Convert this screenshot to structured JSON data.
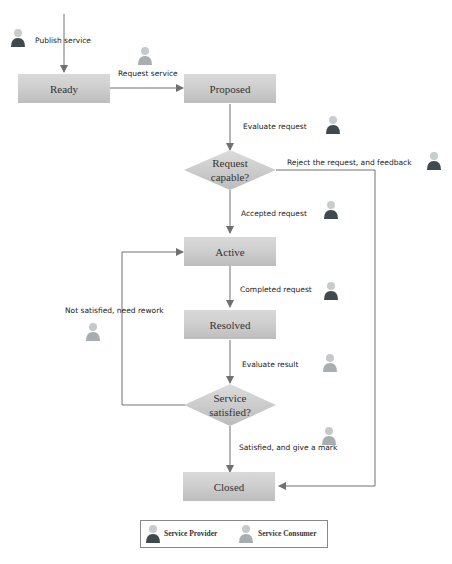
{
  "diagram": {
    "states": {
      "ready": "Ready",
      "proposed": "Proposed",
      "active": "Active",
      "resolved": "Resolved",
      "closed": "Closed"
    },
    "decisions": {
      "request_capable": [
        "Request",
        "capable?"
      ],
      "service_satisfied": [
        "Service",
        "satisfied?"
      ]
    },
    "edge_labels": {
      "publish_service": "Publish service",
      "request_service": "Request service",
      "evaluate_request": "Evaluate request",
      "reject_request": "Reject the request, and feedback",
      "accepted_request": "Accepted request",
      "completed_request": "Completed request",
      "not_satisfied": "Not satisfied, need rework",
      "evaluate_result": "Evaluate result",
      "satisfied": "Satisfied, and give a mark"
    },
    "actors": {
      "provider": "service-provider",
      "consumer": "service-consumer"
    },
    "legend": {
      "provider_label": "Service Provider",
      "consumer_label": "Service Consumer"
    },
    "colors": {
      "provider": "#3f4a4f",
      "consumer": "#a8aeb0",
      "box": "#cfcfcf",
      "line": "#707070"
    }
  }
}
